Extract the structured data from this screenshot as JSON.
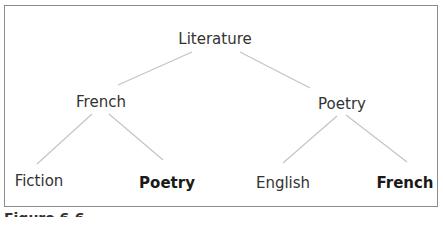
{
  "diagram": {
    "type": "tree",
    "root": {
      "label": "Literature",
      "children": [
        {
          "label": "French",
          "children": [
            {
              "label": "Fiction",
              "bold": false
            },
            {
              "label": "Poetry",
              "bold": true
            }
          ]
        },
        {
          "label": "Poetry",
          "children": [
            {
              "label": "English",
              "bold": false
            },
            {
              "label": "French",
              "bold": true
            }
          ]
        }
      ]
    }
  },
  "nodes": {
    "root": "Literature",
    "mid_left": "French",
    "mid_right": "Poetry",
    "leaf_1": "Fiction",
    "leaf_2": "Poetry",
    "leaf_3": "English",
    "leaf_4": "French"
  },
  "caption": "Figure 6.6"
}
